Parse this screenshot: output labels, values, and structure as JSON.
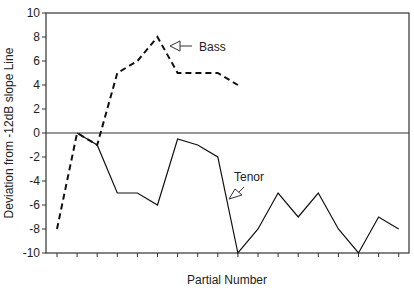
{
  "chart_data": {
    "type": "line",
    "title": "",
    "xlabel": "Partial Number",
    "ylabel": "Deviation from -12dB slope Line",
    "ylim": [
      -10,
      10
    ],
    "yticks": [
      10,
      8,
      6,
      4,
      2,
      0,
      -2,
      -4,
      -6,
      -8,
      -10
    ],
    "x": [
      1,
      2,
      3,
      4,
      5,
      6,
      7,
      8,
      9,
      10,
      11,
      12,
      13,
      14,
      15,
      16,
      17,
      18
    ],
    "grid": false,
    "legend": "annotations",
    "series": [
      {
        "name": "Bass",
        "style": "dashed",
        "values": [
          -8,
          0,
          -1,
          5,
          6,
          8,
          5,
          5,
          5,
          4,
          null,
          null,
          null,
          null,
          null,
          null,
          null,
          null
        ]
      },
      {
        "name": "Tenor",
        "style": "solid",
        "values": [
          null,
          0,
          -1,
          -5,
          -5,
          -6,
          -0.5,
          -1,
          -2,
          -10,
          -8,
          -5,
          -7,
          -5,
          -8,
          -10,
          -7,
          -8
        ]
      }
    ],
    "annotations": [
      {
        "text": "Bass",
        "target_series": "Bass"
      },
      {
        "text": "Tenor",
        "target_series": "Tenor"
      }
    ]
  }
}
